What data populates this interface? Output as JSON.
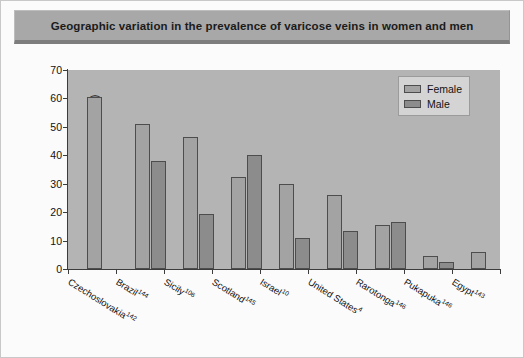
{
  "figure": {
    "title": "Geographic variation in the prevalence of varicose veins in women and men"
  },
  "legend": {
    "position": "top-right",
    "entries": [
      {
        "label": "Female",
        "color": "#a3a3a3"
      },
      {
        "label": "Male",
        "color": "#8c8c8c"
      }
    ]
  },
  "axes": {
    "ylabel": "Prevalence of varicose veins (%)",
    "yticks": [
      "0",
      "10",
      "20",
      "30",
      "40",
      "50",
      "60",
      "70"
    ],
    "xlabel": ""
  },
  "chart_data": {
    "type": "bar",
    "title": "Geographic variation in the prevalence of varicose veins in women and men",
    "xlabel": "",
    "ylabel": "Prevalence of varicose veins (%)",
    "ylim": [
      0,
      70
    ],
    "ytick_step": 10,
    "grid": false,
    "legend_position": "upper right",
    "categories": [
      "Czechoslovakia",
      "Brazil",
      "Sicily",
      "Scotland",
      "Israel",
      "United States",
      "Rarotonga",
      "Pukapuka",
      "Egypt"
    ],
    "category_citations": [
      "142",
      "144",
      "106",
      "145",
      "10",
      "4",
      "146",
      "146",
      "143"
    ],
    "category_labels": [
      "Czechoslovakia142",
      "Brazil144",
      "Sicily106",
      "Scotland145",
      "Israel10",
      "United States4",
      "Rarotonga146",
      "Pukapuka146",
      "Egypt143"
    ],
    "series": [
      {
        "name": "Female",
        "color": "#a3a3a3",
        "values": [
          60.5,
          51,
          46.5,
          32.5,
          30,
          26,
          15.5,
          4.5,
          6
        ]
      },
      {
        "name": "Male",
        "color": "#8c8c8c",
        "values": [
          null,
          38,
          19.5,
          40,
          11,
          13.5,
          16.5,
          2.5,
          null
        ]
      }
    ]
  }
}
